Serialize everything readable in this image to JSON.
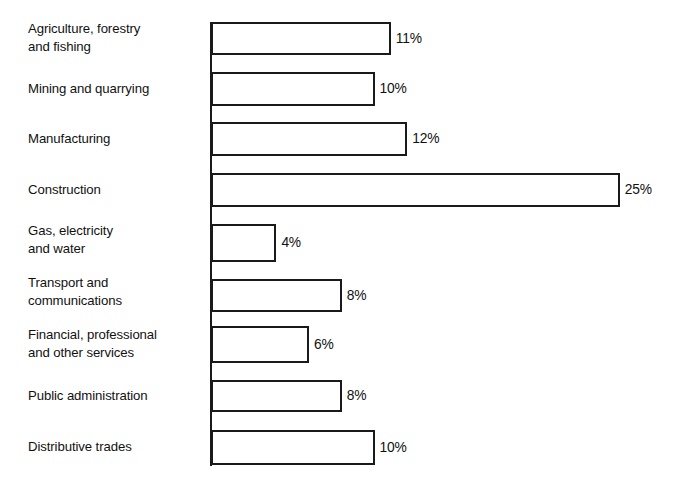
{
  "chart_data": {
    "type": "bar",
    "orientation": "horizontal",
    "title": "",
    "subtitle": "",
    "xlabel": "",
    "ylabel": "",
    "xlim": [
      0,
      25
    ],
    "grid": false,
    "legend": null,
    "value_suffix": "%",
    "categories": [
      "Agriculture, forestry\nand fishing",
      "Mining and quarrying",
      "Manufacturing",
      "Construction",
      "Gas, electricity\nand water",
      "Transport and\ncommunications",
      "Financial, professional\nand other services",
      "Public administration",
      "Distributive trades"
    ],
    "values": [
      11,
      10,
      12,
      25,
      4,
      8,
      6,
      8,
      10
    ],
    "value_labels": [
      "11%",
      "10%",
      "12%",
      "25%",
      "4%",
      "8%",
      "6%",
      "8%",
      "10%"
    ],
    "colors": {
      "bar_fill": "#ffffff",
      "bar_outline": "#1a1a1a",
      "axis": "#1a1a1a",
      "text": "#111111",
      "background": "#ffffff"
    }
  },
  "rows": [
    {
      "label": "Agriculture, forestry\nand fishing",
      "value_label": "11%",
      "value": 11,
      "top": 22,
      "height": 33,
      "label_top": 20
    },
    {
      "label": "Mining and quarrying",
      "value_label": "10%",
      "value": 10,
      "top": 72,
      "height": 34,
      "label_top": 80
    },
    {
      "label": "Manufacturing",
      "value_label": "12%",
      "value": 12,
      "top": 122,
      "height": 34,
      "label_top": 130
    },
    {
      "label": "Construction",
      "value_label": "25%",
      "value": 25,
      "top": 173,
      "height": 34,
      "label_top": 181
    },
    {
      "label": "Gas, electricity\nand water",
      "value_label": "4%",
      "value": 4,
      "top": 224,
      "height": 38,
      "label_top": 222
    },
    {
      "label": "Transport and\ncommunications",
      "value_label": "8%",
      "value": 8,
      "top": 279,
      "height": 33,
      "label_top": 274
    },
    {
      "label": "Financial, professional\nand other services",
      "value_label": "6%",
      "value": 6,
      "top": 326,
      "height": 37,
      "label_top": 326
    },
    {
      "label": "Public administration",
      "value_label": "8%",
      "value": 8,
      "top": 380,
      "height": 32,
      "label_top": 387
    },
    {
      "label": "Distributive trades",
      "value_label": "10%",
      "value": 10,
      "top": 430,
      "height": 35,
      "label_top": 438
    }
  ],
  "geometry": {
    "axis_x": 210,
    "bar_origin_x": 211,
    "px_per_percent": 16.35,
    "value_gap": 5
  }
}
